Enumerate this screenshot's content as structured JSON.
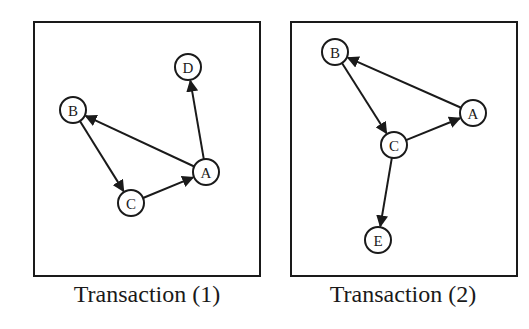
{
  "colors": {
    "ink": "#1a1a1a",
    "background": "#ffffff"
  },
  "panels": [
    {
      "caption": "Transaction (1)",
      "box": {
        "x": 34,
        "y": 22,
        "w": 226,
        "h": 254
      },
      "caption_pos": {
        "x": 147,
        "y": 302
      },
      "nodes": [
        {
          "id": "A",
          "label": "A",
          "x": 206,
          "y": 172
        },
        {
          "id": "B",
          "label": "B",
          "x": 73,
          "y": 110
        },
        {
          "id": "C",
          "label": "C",
          "x": 131,
          "y": 203
        },
        {
          "id": "D",
          "label": "D",
          "x": 188,
          "y": 67
        }
      ],
      "edges": [
        {
          "from": "A",
          "to": "B"
        },
        {
          "from": "B",
          "to": "C"
        },
        {
          "from": "C",
          "to": "A"
        },
        {
          "from": "A",
          "to": "D"
        }
      ]
    },
    {
      "caption": "Transaction (2)",
      "box": {
        "x": 291,
        "y": 22,
        "w": 226,
        "h": 254
      },
      "caption_pos": {
        "x": 403,
        "y": 302
      },
      "nodes": [
        {
          "id": "A",
          "label": "A",
          "x": 473,
          "y": 113
        },
        {
          "id": "B",
          "label": "B",
          "x": 335,
          "y": 52
        },
        {
          "id": "C",
          "label": "C",
          "x": 394,
          "y": 145
        },
        {
          "id": "E",
          "label": "E",
          "x": 378,
          "y": 240
        }
      ],
      "edges": [
        {
          "from": "A",
          "to": "B"
        },
        {
          "from": "B",
          "to": "C"
        },
        {
          "from": "C",
          "to": "A"
        },
        {
          "from": "C",
          "to": "E"
        }
      ]
    }
  ],
  "node_radius": 13
}
